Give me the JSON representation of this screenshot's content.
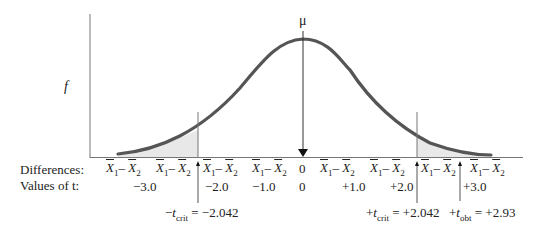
{
  "diagram": {
    "type": "t-distribution with two-tailed rejection regions",
    "y_axis_label": "f",
    "mean_label": "μ",
    "row_labels": {
      "differences": "Differences:",
      "t_values": "Values of t:"
    },
    "difference_label": {
      "x1": "X",
      "sub1": "1",
      "minus": "– ",
      "x2": "X",
      "sub2": "2"
    },
    "difference_positions_count": 9,
    "t_values": [
      "−3.0",
      "−2.0",
      "−1.0",
      "0",
      "+1.0",
      "+2.0",
      "+3.0"
    ],
    "zero_difference": "0",
    "critical_lower": {
      "prefix": "−",
      "t": "t",
      "sub": "crit",
      "value": " = −2.042"
    },
    "critical_upper": {
      "prefix": "+",
      "t": "t",
      "sub": "crit",
      "value": " = +2.042"
    },
    "obtained": {
      "prefix": "+",
      "t": "t",
      "sub": "obt",
      "value": " = +2.93"
    },
    "colors": {
      "curve": "#555555",
      "shade": "#e6e6e6",
      "axis": "#777777",
      "text": "#222222"
    }
  }
}
